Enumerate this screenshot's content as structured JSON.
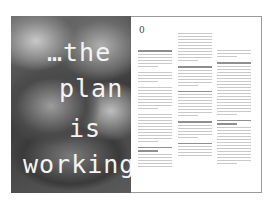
{
  "document": {
    "type": "magazine spread",
    "headline": {
      "lines": [
        "…the",
        "plan",
        "is",
        "working"
      ],
      "color": "#f4f4f4"
    },
    "photo": {
      "description": "grayscale close-up photograph of petals/objects behind headline"
    },
    "page_number": "0",
    "body_text": {
      "legible": false,
      "columns": 3
    }
  }
}
